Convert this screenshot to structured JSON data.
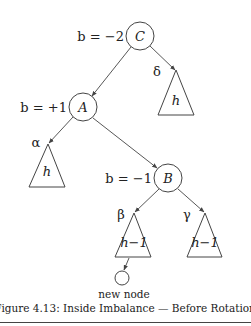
{
  "caption": "Figure 4.13: Inside Imbalance — Before Rotation",
  "nodes": {
    "C": {
      "label": "C",
      "balance_label": "b = −2"
    },
    "A": {
      "label": "A",
      "balance_label": "b = +1"
    },
    "B": {
      "label": "B",
      "balance_label": "b = −1"
    },
    "new": {
      "label": "new node"
    }
  },
  "subtrees": {
    "delta": {
      "edge_label": "δ",
      "height_label": "h"
    },
    "alpha": {
      "edge_label": "α",
      "height_label": "h"
    },
    "beta": {
      "edge_label": "β",
      "height_label": "h−1"
    },
    "gamma": {
      "edge_label": "γ",
      "height_label": "h−1"
    }
  },
  "colors": {
    "line": "#444444",
    "text": "#222222",
    "background": "#ffffff"
  }
}
